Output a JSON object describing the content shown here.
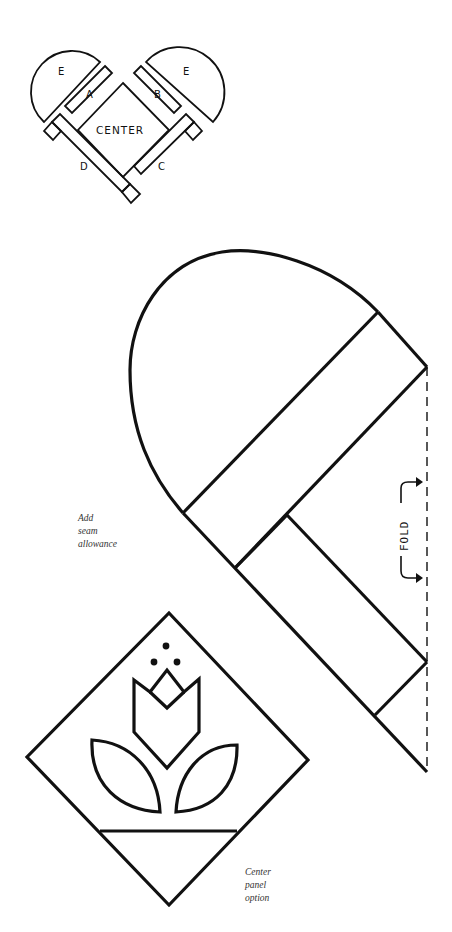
{
  "heart_diagram": {
    "pieces": {
      "e_left": "E",
      "e_right": "E",
      "a": "A",
      "b": "B",
      "c": "C",
      "d": "D",
      "center": "CENTER"
    }
  },
  "pattern": {
    "fold_label": "FOLD",
    "seam_note": [
      "Add",
      "seam",
      "allowance"
    ]
  },
  "center_option": {
    "note": [
      "Center",
      "panel",
      "option"
    ]
  },
  "colors": {
    "ink": "#111111",
    "background": "#ffffff"
  }
}
